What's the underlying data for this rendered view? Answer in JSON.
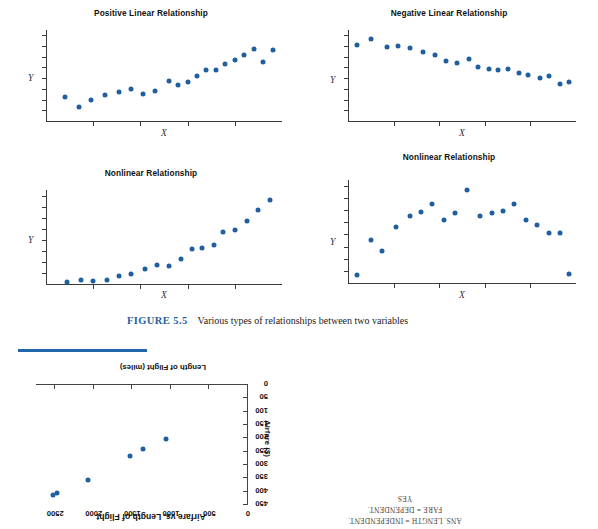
{
  "figure": {
    "caption_number": "FIGURE 5.5",
    "caption_text": "Various types of relationships between two variables"
  },
  "panels": [
    {
      "id": "positive-linear",
      "title": "Positive Linear Relationship",
      "xlabel": "X",
      "ylabel": "Y",
      "chart_data": {
        "type": "scatter",
        "title": "Positive Linear Relationship",
        "xlabel": "X",
        "ylabel": "Y",
        "xlim": [
          0,
          100
        ],
        "ylim": [
          0,
          100
        ],
        "grid": false,
        "legend": null,
        "x": [
          8,
          14,
          19,
          25,
          31,
          36,
          41,
          46,
          52,
          56,
          60,
          64,
          68,
          72,
          76,
          80,
          84,
          88,
          92,
          96
        ],
        "y": [
          27,
          16,
          24,
          29,
          33,
          36,
          30,
          34,
          45,
          40,
          44,
          50,
          57,
          56,
          63,
          67,
          73,
          79,
          65,
          78
        ]
      }
    },
    {
      "id": "negative-linear",
      "title": "Negative Linear Relationship",
      "xlabel": "X",
      "ylabel": "Y",
      "chart_data": {
        "type": "scatter",
        "title": "Negative Linear Relationship",
        "xlabel": "X",
        "ylabel": "Y",
        "xlim": [
          0,
          100
        ],
        "ylim": [
          0,
          100
        ],
        "grid": false,
        "legend": null,
        "x": [
          4,
          10,
          17,
          22,
          27,
          33,
          38,
          43,
          48,
          53,
          57,
          62,
          66,
          70,
          75,
          79,
          84,
          88,
          93,
          97
        ],
        "y": [
          84,
          90,
          82,
          83,
          80,
          76,
          73,
          66,
          64,
          68,
          60,
          58,
          57,
          58,
          53,
          51,
          48,
          50,
          41,
          44
        ]
      }
    },
    {
      "id": "nonlinear-exponential",
      "title": "Nonlinear Relationship",
      "xlabel": "X",
      "ylabel": "Y",
      "chart_data": {
        "type": "scatter",
        "title": "Nonlinear Relationship",
        "xlabel": "X",
        "ylabel": "Y",
        "xlim": [
          0,
          100
        ],
        "ylim": [
          0,
          100
        ],
        "grid": false,
        "legend": null,
        "x": [
          9,
          15,
          20,
          26,
          31,
          36,
          42,
          47,
          52,
          57,
          62,
          66,
          71,
          75,
          80,
          85,
          90,
          95
        ],
        "y": [
          3,
          5,
          4,
          5,
          10,
          12,
          17,
          21,
          20,
          27,
          38,
          39,
          42,
          56,
          58,
          67,
          79,
          90
        ]
      }
    },
    {
      "id": "nonlinear-curved",
      "title": "Nonlinear Relationship",
      "xlabel": "X",
      "ylabel": "Y",
      "chart_data": {
        "type": "scatter",
        "title": "Nonlinear Relationship",
        "xlabel": "X",
        "ylabel": "Y",
        "xlim": [
          0,
          100
        ],
        "ylim": [
          0,
          100
        ],
        "grid": false,
        "legend": null,
        "x": [
          4,
          10,
          15,
          21,
          27,
          32,
          37,
          42,
          47,
          52,
          58,
          63,
          68,
          73,
          78,
          83,
          88,
          93,
          97
        ],
        "y": [
          9,
          42,
          32,
          55,
          65,
          69,
          77,
          62,
          68,
          90,
          65,
          68,
          70,
          77,
          62,
          57,
          49,
          49,
          10
        ]
      }
    }
  ],
  "bottom_chart": {
    "title": "Airfare vs. Length of Flight",
    "xlabel": "Length of Flight (miles)",
    "ylabel": "Airfare ($)",
    "rotated": "180",
    "chart_data": {
      "type": "scatter",
      "title": "Airfare vs. Length of Flight",
      "xlabel": "Length of Flight (miles)",
      "ylabel": "Airfare ($)",
      "xlim": [
        0,
        2750
      ],
      "ylim": [
        0,
        450
      ],
      "xticks": [
        "0",
        "500",
        "1000",
        "1500",
        "2000",
        "2500"
      ],
      "yticks": [
        "0",
        "50",
        "100",
        "150",
        "200",
        "250",
        "300",
        "350",
        "400",
        "450"
      ],
      "grid": false,
      "legend": null,
      "points": [
        {
          "x": 1060,
          "y": 205
        },
        {
          "x": 1360,
          "y": 245
        },
        {
          "x": 1530,
          "y": 270
        },
        {
          "x": 2080,
          "y": 360
        },
        {
          "x": 2480,
          "y": 410
        },
        {
          "x": 2530,
          "y": 415
        }
      ]
    }
  },
  "answer_note": {
    "line1": "ANS. LENGTH = INDEPENDENT.",
    "line2": "FARE = DEPENDENT.",
    "line3": "YES"
  },
  "colors": {
    "dot_blue": "#1f5fa0",
    "rule_blue": "#2266aa",
    "caption_blue": "#1f5fa0",
    "axis_gray": "#3a3a3a"
  }
}
